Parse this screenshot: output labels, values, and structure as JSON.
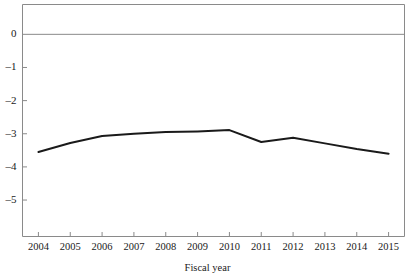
{
  "chart_data": {
    "type": "line",
    "title": "",
    "subtitle": "",
    "xlabel": "Fiscal year",
    "ylabel": "",
    "categories": [
      "2004",
      "2005",
      "2006",
      "2007",
      "2008",
      "2009",
      "2010",
      "2011",
      "2012",
      "2013",
      "2014",
      "2015"
    ],
    "x": [
      2004,
      2005,
      2006,
      2007,
      2008,
      2009,
      2010,
      2011,
      2012,
      2013,
      2014,
      2015
    ],
    "values": [
      -3.55,
      -3.28,
      -3.07,
      -3.0,
      -2.95,
      -2.93,
      -2.89,
      -3.25,
      -3.12,
      -3.29,
      -3.46,
      -3.6
    ],
    "series": [
      {
        "name": "",
        "values": [
          -3.55,
          -3.28,
          -3.07,
          -3.0,
          -2.95,
          -2.93,
          -2.89,
          -3.25,
          -3.12,
          -3.29,
          -3.46,
          -3.6
        ],
        "color": "#1a1a1a"
      }
    ],
    "ylim": [
      -6.1,
      0.9
    ],
    "xlim": [
      2003.5,
      2015.5
    ],
    "yticks": [
      0,
      -1,
      -2,
      -3,
      -4,
      -5
    ],
    "ytick_labels": [
      "0",
      "–1",
      "–2",
      "–3",
      "–4",
      "–5"
    ],
    "xticks": [
      2004,
      2005,
      2006,
      2007,
      2008,
      2009,
      2010,
      2011,
      2012,
      2013,
      2014,
      2015
    ],
    "grid": false,
    "legend": false,
    "legend_position": "none",
    "zero_line": 0,
    "annotations": []
  },
  "colors": {
    "line": "#1a1a1a",
    "axis": "#8a8a8a",
    "zero_rule": "#8a8a8a",
    "text": "#1a1a1a",
    "background": "#ffffff"
  }
}
